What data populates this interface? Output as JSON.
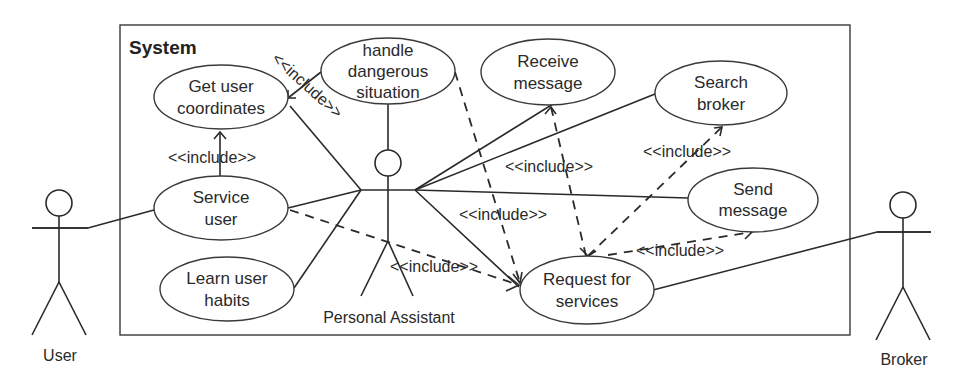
{
  "diagram": {
    "type": "uml-use-case",
    "system_label": "System",
    "actors": [
      {
        "id": "user",
        "label": "User"
      },
      {
        "id": "personal_assistant",
        "label": "Personal Assistant"
      },
      {
        "id": "broker",
        "label": "Broker"
      }
    ],
    "use_cases": [
      {
        "id": "get_user_coordinates",
        "line1": "Get user",
        "line2": "coordinates"
      },
      {
        "id": "handle_dangerous_situation",
        "line1": "handle",
        "line2": "dangerous",
        "line3": "situation"
      },
      {
        "id": "receive_message",
        "line1": "Receive",
        "line2": "message"
      },
      {
        "id": "search_broker",
        "line1": "Search",
        "line2": "broker"
      },
      {
        "id": "send_message",
        "line1": "Send",
        "line2": "message"
      },
      {
        "id": "service_user",
        "line1": "Service",
        "line2": "user"
      },
      {
        "id": "learn_user_habits",
        "line1": "Learn user",
        "line2": "habits"
      },
      {
        "id": "request_for_services",
        "line1": "Request for",
        "line2": "services"
      }
    ],
    "include_label": "<<include>>",
    "relationships": [
      {
        "from": "user",
        "to": "service_user",
        "kind": "association"
      },
      {
        "from": "personal_assistant",
        "to": "get_user_coordinates",
        "kind": "association"
      },
      {
        "from": "personal_assistant",
        "to": "handle_dangerous_situation",
        "kind": "association"
      },
      {
        "from": "personal_assistant",
        "to": "service_user",
        "kind": "association"
      },
      {
        "from": "personal_assistant",
        "to": "learn_user_habits",
        "kind": "association"
      },
      {
        "from": "personal_assistant",
        "to": "receive_message",
        "kind": "association"
      },
      {
        "from": "personal_assistant",
        "to": "search_broker",
        "kind": "association"
      },
      {
        "from": "personal_assistant",
        "to": "send_message",
        "kind": "association"
      },
      {
        "from": "personal_assistant",
        "to": "request_for_services",
        "kind": "association"
      },
      {
        "from": "broker",
        "to": "request_for_services",
        "kind": "association"
      },
      {
        "from": "service_user",
        "to": "get_user_coordinates",
        "kind": "include"
      },
      {
        "from": "handle_dangerous_situation",
        "to": "get_user_coordinates",
        "kind": "include"
      },
      {
        "from": "service_user",
        "to": "request_for_services",
        "kind": "include"
      },
      {
        "from": "handle_dangerous_situation",
        "to": "request_for_services",
        "kind": "include"
      },
      {
        "from": "request_for_services",
        "to": "receive_message",
        "kind": "include"
      },
      {
        "from": "request_for_services",
        "to": "search_broker",
        "kind": "include"
      },
      {
        "from": "request_for_services",
        "to": "send_message",
        "kind": "include"
      }
    ]
  }
}
